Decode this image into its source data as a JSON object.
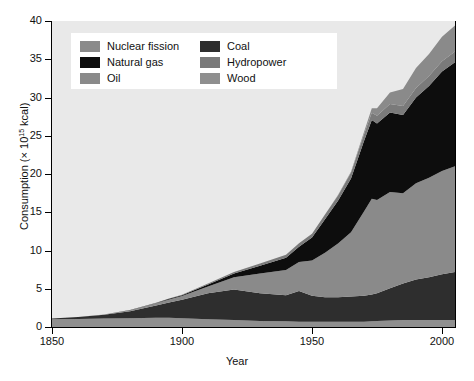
{
  "chart_data": {
    "type": "area",
    "stacked": true,
    "title": "",
    "xlabel": "Year",
    "ylabel": "Consumption (× 10¹⁵ kcal)",
    "ylabel_parts": {
      "main": "Consumption (× 10",
      "sup": "15",
      "tail": " kcal)"
    },
    "xlim": [
      1850,
      2005
    ],
    "ylim": [
      0,
      40
    ],
    "xticks": [
      1850,
      1900,
      1950,
      2000
    ],
    "yticks": [
      0,
      5,
      10,
      15,
      20,
      25,
      30,
      35,
      40
    ],
    "grid": false,
    "legend_position": "upper-left-inside",
    "plot_background": "#e9e9e9",
    "x": [
      1850,
      1860,
      1870,
      1880,
      1890,
      1895,
      1900,
      1910,
      1920,
      1930,
      1940,
      1945,
      1950,
      1955,
      1960,
      1965,
      1970,
      1973,
      1975,
      1980,
      1985,
      1990,
      1995,
      2000,
      2005
    ],
    "series": [
      {
        "name": "Wood",
        "color": "#8f8f8f",
        "values": [
          1.0,
          1.05,
          1.1,
          1.15,
          1.2,
          1.2,
          1.15,
          1.0,
          0.9,
          0.8,
          0.75,
          0.7,
          0.7,
          0.7,
          0.7,
          0.7,
          0.7,
          0.75,
          0.8,
          0.85,
          0.9,
          0.9,
          0.9,
          0.9,
          0.9
        ]
      },
      {
        "name": "Coal",
        "color": "#2e2e2e",
        "values": [
          0.1,
          0.25,
          0.5,
          0.9,
          1.6,
          2.0,
          2.4,
          3.4,
          4.0,
          3.6,
          3.4,
          4.0,
          3.4,
          3.2,
          3.2,
          3.3,
          3.4,
          3.5,
          3.6,
          4.2,
          4.8,
          5.3,
          5.6,
          6.0,
          6.3
        ]
      },
      {
        "name": "Oil",
        "color": "#8a8a8a",
        "values": [
          0.0,
          0.0,
          0.05,
          0.15,
          0.3,
          0.4,
          0.5,
          0.9,
          1.6,
          2.6,
          3.3,
          3.8,
          4.6,
          5.8,
          7.0,
          8.4,
          11.0,
          12.5,
          12.2,
          12.6,
          11.8,
          12.6,
          13.0,
          13.5,
          13.8
        ]
      },
      {
        "name": "Natural gas",
        "color": "#0d0d0d",
        "values": [
          0.0,
          0.0,
          0.0,
          0.02,
          0.05,
          0.08,
          0.1,
          0.25,
          0.5,
          1.0,
          1.6,
          2.0,
          3.0,
          4.4,
          5.6,
          7.0,
          9.2,
          10.3,
          10.0,
          10.4,
          10.2,
          11.2,
          12.0,
          13.0,
          13.6
        ]
      },
      {
        "name": "Hydropower",
        "color": "#7a7a7a",
        "values": [
          0.0,
          0.0,
          0.0,
          0.0,
          0.02,
          0.04,
          0.06,
          0.12,
          0.2,
          0.3,
          0.4,
          0.45,
          0.5,
          0.6,
          0.7,
          0.8,
          0.9,
          0.95,
          1.0,
          1.1,
          1.2,
          1.25,
          1.3,
          1.35,
          1.4
        ]
      },
      {
        "name": "Nuclear fission",
        "color": "#8a8a8a",
        "values": [
          0.0,
          0.0,
          0.0,
          0.0,
          0.0,
          0.0,
          0.0,
          0.0,
          0.0,
          0.0,
          0.0,
          0.0,
          0.0,
          0.02,
          0.05,
          0.1,
          0.3,
          0.6,
          1.0,
          1.5,
          2.2,
          2.6,
          2.9,
          3.2,
          3.4
        ]
      }
    ],
    "legend_order": [
      {
        "name": "Nuclear fission",
        "color": "#8a8a8a"
      },
      {
        "name": "Coal",
        "color": "#2e2e2e"
      },
      {
        "name": "Natural gas",
        "color": "#0d0d0d"
      },
      {
        "name": "Hydropower",
        "color": "#7a7a7a"
      },
      {
        "name": "Oil",
        "color": "#8a8a8a"
      },
      {
        "name": "Wood",
        "color": "#8f8f8f"
      }
    ]
  }
}
